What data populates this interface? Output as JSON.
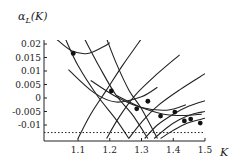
{
  "chart_data": {
    "type": "line",
    "title": "",
    "ylabel": "α_L(K)",
    "xlabel": "K",
    "xlim": [
      1.0,
      1.5
    ],
    "ylim": [
      -0.015,
      0.0225
    ],
    "x_ticks": [
      1.1,
      1.2,
      1.3,
      1.4,
      1.5
    ],
    "x_tick_labels": [
      "1.1",
      "1.2",
      "1.3",
      "1.4",
      "1.5"
    ],
    "y_ticks": [
      0.02,
      0.015,
      0.01,
      0.005,
      0,
      -0.005,
      -0.01
    ],
    "y_tick_labels": [
      "0.02",
      "0.015",
      "0.01",
      "0.005",
      "0",
      "-0.005",
      "-0.01"
    ],
    "grid": false,
    "legend": null,
    "dotted_line": {
      "y": -0.0128,
      "style": "dotted",
      "orientation": "horizontal"
    },
    "series": [
      {
        "name": "U-curve-1",
        "kind": "convex",
        "points": [
          [
            1.03,
            0.022
          ],
          [
            1.08,
            0.0175
          ],
          [
            1.13,
            0.0165
          ],
          [
            1.18,
            0.019
          ],
          [
            1.2,
            0.0205
          ]
        ]
      },
      {
        "name": "U-curve-2",
        "kind": "convex",
        "points": [
          [
            1.07,
            0.0105
          ],
          [
            1.15,
            0.002
          ],
          [
            1.22,
            -0.0015
          ],
          [
            1.3,
            0.0005
          ],
          [
            1.35,
            0.004
          ]
        ]
      },
      {
        "name": "U-curve-3",
        "kind": "convex",
        "points": [
          [
            1.14,
            0.0065
          ],
          [
            1.22,
            0.0005
          ],
          [
            1.3,
            -0.0035
          ],
          [
            1.38,
            -0.0045
          ],
          [
            1.44,
            -0.0025
          ]
        ]
      },
      {
        "name": "U-curve-4",
        "kind": "convex",
        "points": [
          [
            1.22,
            0.001
          ],
          [
            1.3,
            -0.0035
          ],
          [
            1.37,
            -0.006
          ],
          [
            1.43,
            -0.0065
          ],
          [
            1.49,
            -0.006
          ]
        ]
      },
      {
        "name": "branch-a",
        "kind": "steep",
        "points": [
          [
            1.06,
            0.022
          ],
          [
            1.1,
            0.012
          ],
          [
            1.16,
            0.001
          ],
          [
            1.22,
            -0.008
          ],
          [
            1.26,
            -0.015
          ]
        ]
      },
      {
        "name": "branch-b",
        "kind": "steep",
        "points": [
          [
            1.12,
            0.022
          ],
          [
            1.17,
            0.011
          ],
          [
            1.22,
            0.001
          ],
          [
            1.27,
            -0.006
          ],
          [
            1.32,
            -0.015
          ]
        ]
      },
      {
        "name": "branch-c",
        "kind": "steep",
        "points": [
          [
            1.19,
            0.022
          ],
          [
            1.22,
            0.013
          ],
          [
            1.26,
            0.003
          ],
          [
            1.3,
            -0.004
          ],
          [
            1.35,
            -0.015
          ]
        ]
      },
      {
        "name": "rising-1",
        "kind": "rising",
        "points": [
          [
            1.1,
            -0.015
          ],
          [
            1.14,
            -0.006
          ],
          [
            1.19,
            0.003
          ],
          [
            1.24,
            0.012
          ],
          [
            1.3,
            0.022
          ]
        ]
      },
      {
        "name": "rising-2",
        "kind": "rising",
        "points": [
          [
            1.19,
            -0.015
          ],
          [
            1.23,
            -0.007
          ],
          [
            1.28,
            0.001
          ],
          [
            1.35,
            0.009
          ],
          [
            1.42,
            0.016
          ]
        ]
      },
      {
        "name": "rising-3",
        "kind": "rising",
        "points": [
          [
            1.26,
            -0.015
          ],
          [
            1.3,
            -0.009
          ],
          [
            1.35,
            -0.003
          ],
          [
            1.42,
            0.003
          ],
          [
            1.5,
            0.009
          ]
        ]
      },
      {
        "name": "rising-4",
        "kind": "rising",
        "points": [
          [
            1.31,
            -0.015
          ],
          [
            1.35,
            -0.01
          ],
          [
            1.4,
            -0.006
          ],
          [
            1.45,
            -0.003
          ],
          [
            1.5,
            -0.001
          ]
        ]
      },
      {
        "name": "rising-5",
        "kind": "rising",
        "points": [
          [
            1.34,
            -0.015
          ],
          [
            1.38,
            -0.011
          ],
          [
            1.42,
            -0.008
          ],
          [
            1.46,
            -0.006
          ],
          [
            1.5,
            -0.005
          ]
        ]
      },
      {
        "name": "rising-6",
        "kind": "rising",
        "points": [
          [
            1.36,
            -0.015
          ],
          [
            1.4,
            -0.012
          ],
          [
            1.44,
            -0.0095
          ],
          [
            1.5,
            -0.0075
          ]
        ]
      }
    ],
    "marked_points": [
      [
        1.085,
        0.0165
      ],
      [
        1.205,
        0.0026
      ],
      [
        1.285,
        -0.004
      ],
      [
        1.32,
        -0.0012
      ],
      [
        1.36,
        -0.0067
      ],
      [
        1.405,
        -0.0052
      ],
      [
        1.435,
        -0.0085
      ],
      [
        1.455,
        -0.0078
      ],
      [
        1.485,
        -0.0093
      ]
    ]
  }
}
